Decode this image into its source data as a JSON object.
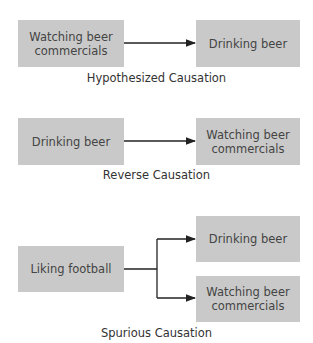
{
  "diagrams": [
    {
      "caption": "Hypothesized Causation",
      "nodes": [
        "Watching beer commercials",
        "Drinking beer"
      ],
      "edges": [
        {
          "from": "Watching beer commercials",
          "to": "Drinking beer"
        }
      ]
    },
    {
      "caption": "Reverse Causation",
      "nodes": [
        "Drinking beer",
        "Watching beer commercials"
      ],
      "edges": [
        {
          "from": "Drinking beer",
          "to": "Watching beer commercials"
        }
      ]
    },
    {
      "caption": "Spurious Causation",
      "nodes": [
        "Liking football",
        "Drinking beer",
        "Watching beer commercials"
      ],
      "edges": [
        {
          "from": "Liking football",
          "to": "Drinking beer"
        },
        {
          "from": "Liking football",
          "to": "Watching beer commercials"
        }
      ]
    }
  ],
  "colors": {
    "box_fill": "#c9c9c9",
    "arrow": "#222222"
  }
}
